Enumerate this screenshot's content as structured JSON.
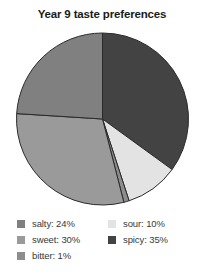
{
  "chart_data": {
    "type": "pie",
    "title": "Year 9 taste preferences",
    "xlabel": "",
    "ylabel": "",
    "legend_position": "bottom",
    "grid": false,
    "start_angle_deg": 0,
    "direction": "clockwise",
    "categories": [
      "spicy",
      "sour",
      "bitter",
      "sweet",
      "salty"
    ],
    "values": [
      35,
      10,
      1,
      30,
      24
    ],
    "unit": "%",
    "slices": [
      {
        "name": "spicy",
        "value": 35,
        "label": "spicy: 35%",
        "color": "#434343"
      },
      {
        "name": "sour",
        "value": 10,
        "label": "sour: 10%",
        "color": "#e3e3e3"
      },
      {
        "name": "bitter",
        "value": 1,
        "label": "bitter: 1%",
        "color": "#8d8d8d"
      },
      {
        "name": "sweet",
        "value": 30,
        "label": "sweet: 30%",
        "color": "#9a9a9a"
      },
      {
        "name": "salty",
        "value": 24,
        "label": "salty: 24%",
        "color": "#808080"
      }
    ],
    "slice_border_color": "#2a2a2a"
  },
  "legend": {
    "columns": [
      {
        "items": [
          {
            "label": "salty: 24%",
            "color": "#808080",
            "name": "salty"
          },
          {
            "label": "sweet: 30%",
            "color": "#9a9a9a",
            "name": "sweet"
          },
          {
            "label": "bitter: 1%",
            "color": "#8d8d8d",
            "name": "bitter"
          }
        ]
      },
      {
        "items": [
          {
            "label": "sour: 10%",
            "color": "#e3e3e3",
            "name": "sour"
          },
          {
            "label": "spicy: 35%",
            "color": "#434343",
            "name": "spicy"
          }
        ]
      }
    ]
  }
}
